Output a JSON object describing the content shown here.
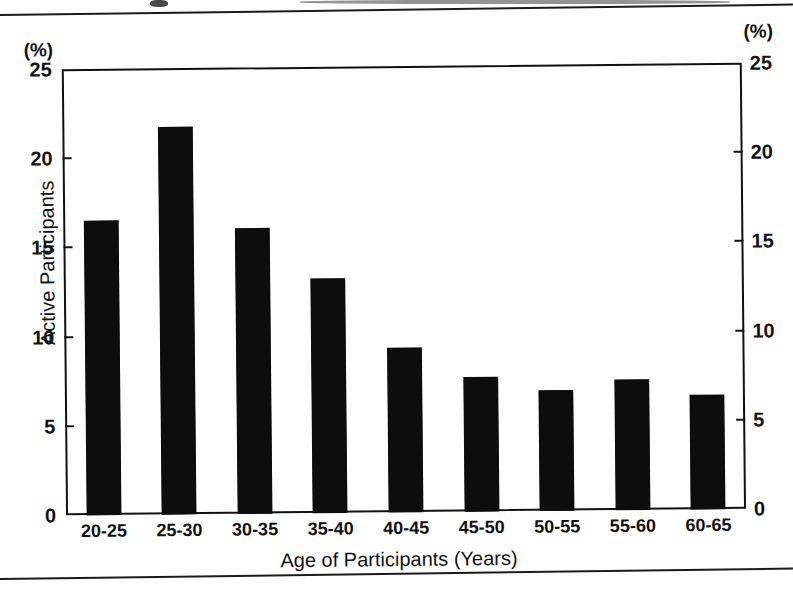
{
  "figure": {
    "unit_label_left": "(%)",
    "unit_label_right": "(%)",
    "y_axis_title": "Active Participants",
    "x_axis_title": "Age of Participants (Years)"
  },
  "chart_data": {
    "type": "bar",
    "title": "",
    "xlabel": "Age of Participants (Years)",
    "ylabel": "Active Participants",
    "y_unit": "(%)",
    "categories": [
      "20-25",
      "25-30",
      "30-35",
      "35-40",
      "40-45",
      "45-50",
      "50-55",
      "55-60",
      "60-65"
    ],
    "values": [
      16.5,
      21.7,
      16.0,
      13.1,
      9.2,
      7.5,
      6.7,
      7.3,
      6.4
    ],
    "ylim": [
      0,
      25
    ],
    "yticks": [
      0,
      5,
      10,
      15,
      20,
      25
    ],
    "ytick_labels": [
      "0",
      "5",
      "10",
      "15",
      "20",
      "25"
    ],
    "right_axis": {
      "enabled": true,
      "unit": "(%)",
      "ticks": [
        0,
        5,
        10,
        15,
        20,
        25
      ],
      "tick_labels": [
        "0",
        "5",
        "10",
        "15",
        "20",
        "25"
      ]
    },
    "grid": false,
    "legend": null,
    "bar_color": "#0d0d0d",
    "frame_color": "#111111"
  }
}
